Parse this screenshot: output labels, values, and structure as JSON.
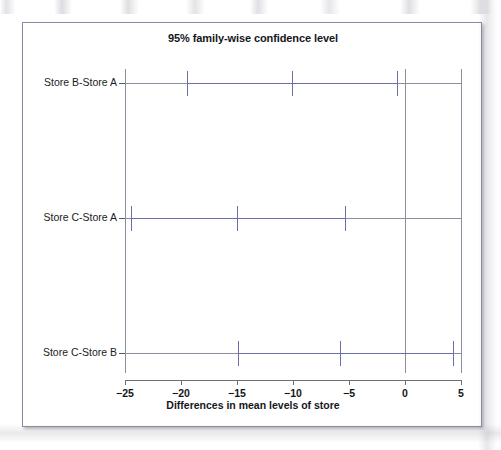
{
  "chart_data": {
    "type": "bar",
    "orientation": "horizontal",
    "plot_kind": "tukey-hsd-confidence-intervals",
    "title": "95% family-wise confidence level",
    "xlabel": "Differences in mean levels of store",
    "ylabel": "",
    "xlim": [
      -26.5,
      6.0
    ],
    "xticks": [
      -25,
      -20,
      -15,
      -10,
      -5,
      0,
      5
    ],
    "xtick_labels": [
      "−25",
      "−20",
      "−15",
      "−10",
      "−5",
      "0",
      "5"
    ],
    "grid": false,
    "legend": null,
    "reference_line": 0,
    "categories": [
      "Store B-Store A",
      "Store C-Store A",
      "Store C-Store B"
    ],
    "series": [
      {
        "name": "lower",
        "values": [
          -19.5,
          -24.5,
          -14.9
        ]
      },
      {
        "name": "difference",
        "values": [
          -10.1,
          -15.0,
          -5.8
        ]
      },
      {
        "name": "upper",
        "values": [
          -0.7,
          -5.4,
          4.3
        ]
      }
    ],
    "intervals": [
      {
        "label": "Store B-Store A",
        "lower": -19.5,
        "center": -10.1,
        "upper": -0.7
      },
      {
        "label": "Store C-Store A",
        "lower": -24.5,
        "center": -15.0,
        "upper": -5.4
      },
      {
        "label": "Store C-Store B",
        "lower": -14.9,
        "center": -5.8,
        "upper": 4.3
      }
    ],
    "colors": {
      "interval": "#6b6fa8",
      "axis": "#6e7079",
      "reference": "#8d8f9e",
      "text": "#15161a",
      "frame": "#8a8ca6",
      "background": "#ffffff"
    }
  },
  "figure": {
    "title": "95% family-wise confidence level",
    "x_axis_title": "Differences in mean levels of store"
  }
}
